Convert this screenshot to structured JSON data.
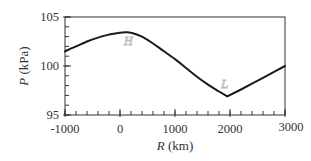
{
  "chart_data": {
    "type": "line",
    "title": "",
    "xlabel": "R (km)",
    "ylabel": "P (kPa)",
    "xlim": [
      -1000,
      3000
    ],
    "ylim": [
      95,
      105
    ],
    "x_ticks": [
      -1000,
      0,
      1000,
      2000,
      3000
    ],
    "y_ticks": [
      95,
      100,
      105
    ],
    "x_minor_step": 200,
    "y_minor_step": 1,
    "grid": false,
    "legend": null,
    "series": [
      {
        "name": "pressure",
        "color": "#1a1a1a",
        "x": [
          -1000,
          -800,
          -600,
          -400,
          -200,
          0,
          100,
          200,
          400,
          600,
          800,
          1000,
          1200,
          1400,
          1600,
          1800,
          1950,
          2200,
          2400,
          2600,
          2800,
          3000
        ],
        "y": [
          101.5,
          102.0,
          102.5,
          102.9,
          103.2,
          103.4,
          103.45,
          103.4,
          103.0,
          102.3,
          101.5,
          100.7,
          99.8,
          98.9,
          98.1,
          97.4,
          96.9,
          97.6,
          98.2,
          98.8,
          99.4,
          100.0
        ]
      }
    ],
    "annotations": [
      {
        "text": "H",
        "x": 150,
        "y": 102.6,
        "color": "#b8b8b8"
      },
      {
        "text": "L",
        "x": 1900,
        "y": 98.2,
        "color": "#b8b8b8"
      }
    ]
  },
  "labels": {
    "x_axis_title_var": "R",
    "x_axis_title_unit": " (km)",
    "y_axis_title_var": "P",
    "y_axis_title_unit": " (kPa)",
    "x_tick_labels": [
      "-1000",
      "0",
      "1000",
      "2000",
      "3000"
    ],
    "y_tick_labels": [
      "95",
      "100",
      "105"
    ],
    "annotation_high": "H",
    "annotation_low": "L"
  }
}
